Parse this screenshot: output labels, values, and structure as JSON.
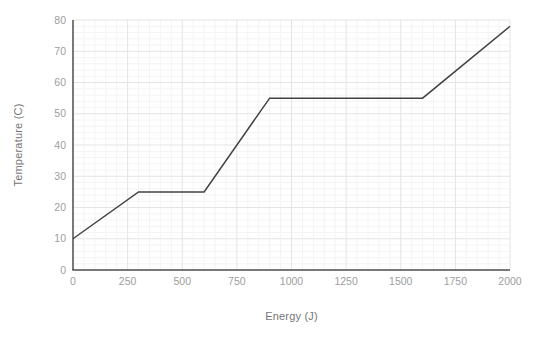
{
  "chart_data": {
    "type": "line",
    "xlabel": "Energy (J)",
    "ylabel": "Temperature (C)",
    "xlim": [
      0,
      2000
    ],
    "ylim": [
      0,
      80
    ],
    "x_ticks": [
      0,
      250,
      500,
      750,
      1000,
      1250,
      1500,
      1750,
      2000
    ],
    "y_ticks": [
      0,
      10,
      20,
      30,
      40,
      50,
      60,
      70,
      80
    ],
    "grid": true,
    "minor_grid": {
      "x_step": 50,
      "y_step": 2
    },
    "legend_position": "none",
    "series": [
      {
        "name": "heating-curve",
        "color": "#424242",
        "points": [
          [
            0,
            10
          ],
          [
            300,
            25
          ],
          [
            600,
            25
          ],
          [
            900,
            55
          ],
          [
            1600,
            55
          ],
          [
            2000,
            78
          ]
        ]
      }
    ],
    "colors": {
      "background": "#ffffff",
      "axis": "#4d4d4d",
      "major_grid": "#e4e4e4",
      "minor_grid": "#f4f4f4",
      "tick_label": "#9e9e9e",
      "axis_label": "#757575"
    }
  }
}
